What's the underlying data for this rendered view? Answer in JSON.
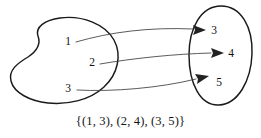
{
  "figure": {
    "caption": "{(1, 3), (2, 4), (3, 5)}",
    "domain_set": {
      "name": "domain-blob",
      "shape": "irregular-blob",
      "elements": [
        {
          "label": "1",
          "x": 68,
          "y": 45
        },
        {
          "label": "2",
          "x": 92,
          "y": 66
        },
        {
          "label": "3",
          "x": 68,
          "y": 92
        }
      ]
    },
    "codomain_set": {
      "name": "codomain-oval",
      "shape": "oval",
      "elements": [
        {
          "label": "3",
          "x": 214,
          "y": 34
        },
        {
          "label": "4",
          "x": 231,
          "y": 55
        },
        {
          "label": "5",
          "x": 219,
          "y": 86
        }
      ]
    },
    "mappings": [
      {
        "from": "1",
        "to": "3",
        "name": "arrow-1-to-3"
      },
      {
        "from": "2",
        "to": "4",
        "name": "arrow-2-to-4"
      },
      {
        "from": "3",
        "to": "5",
        "name": "arrow-3-to-5"
      }
    ],
    "colors": {
      "background": "#ffffff",
      "outline": "#1a1a1a",
      "arrow": "#3d3d3d",
      "text": "#111111"
    }
  }
}
